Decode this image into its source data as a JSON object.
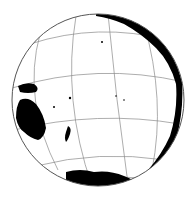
{
  "map": {
    "title": "Orthographic globe centered on the Pacific Ocean",
    "projection": "orthographic",
    "center_region": "Pacific Ocean",
    "graticule": true,
    "colors": {
      "land": "#000000",
      "ocean": "#ffffff",
      "graticule": "#8a8a8a",
      "outline": "#555555"
    },
    "visible_landmasses": [
      "Australia",
      "New Guinea",
      "New Zealand",
      "Antarctica",
      "Americas (western coast)",
      "Pacific islands"
    ]
  }
}
